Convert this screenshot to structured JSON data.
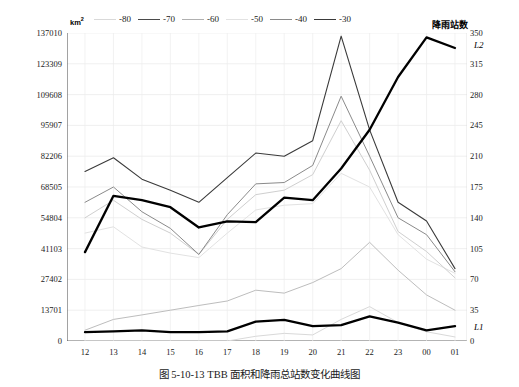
{
  "figure": {
    "caption": "图 5-10-13    TBB 面积和降雨总站数变化曲线图",
    "unit_left": "km",
    "unit_left_sup": "2",
    "right_axis_title": "降雨站数",
    "series_label_top": "L2",
    "series_label_bottom": "L1"
  },
  "legend": {
    "items": [
      {
        "label": "-80",
        "color": "#d9d9d9",
        "width": 1.0
      },
      {
        "label": "-70",
        "color": "#4a4a4a",
        "width": 1.1
      },
      {
        "label": "-60",
        "color": "#b0b0b0",
        "width": 1.0
      },
      {
        "label": "-50",
        "color": "#e2e2e2",
        "width": 1.0
      },
      {
        "label": "-40",
        "color": "#8a8a8a",
        "width": 1.0
      },
      {
        "label": "-30",
        "color": "#3a3a3a",
        "width": 1.2
      }
    ]
  },
  "chart_data": {
    "type": "line",
    "title": "TBB 面积和降雨总站数变化曲线图",
    "xlabel": "",
    "ylabel": "km2",
    "ylabel_right": "降雨站数",
    "grid": true,
    "legend_position": "top",
    "x": [
      "12",
      "13",
      "14",
      "15",
      "16",
      "17",
      "18",
      "19",
      "20",
      "21",
      "22",
      "23",
      "00",
      "01"
    ],
    "ylim": [
      0,
      137010
    ],
    "yticks": [
      0,
      13701,
      27402,
      41103,
      54804,
      68505,
      82206,
      95907,
      109608,
      123309,
      137010
    ],
    "ylim_right": [
      0,
      350
    ],
    "yticks_right": [
      0,
      35,
      70,
      105,
      140,
      175,
      210,
      245,
      280,
      315,
      350
    ],
    "series": [
      {
        "name": "-80",
        "axis": "left",
        "color": "#d9d9d9",
        "width": 1.0,
        "values": [
          0,
          0,
          0,
          0,
          0,
          0,
          2100,
          3400,
          2700,
          9600,
          15300,
          8200,
          4100,
          1800
        ]
      },
      {
        "name": "-70",
        "axis": "left",
        "color": "#bdbdbd",
        "width": 1.0,
        "values": [
          4800,
          9600,
          11600,
          13700,
          15800,
          17800,
          22600,
          21300,
          26000,
          32200,
          43900,
          31500,
          20500,
          13700
        ]
      },
      {
        "name": "-60",
        "axis": "left",
        "color": "#e2e2e2",
        "width": 1.0,
        "values": [
          48000,
          50800,
          41800,
          39100,
          37100,
          48000,
          58300,
          60400,
          61100,
          74600,
          68500,
          47300,
          36400,
          30100
        ]
      },
      {
        "name": "-50",
        "axis": "left",
        "color": "#cfcfcf",
        "width": 1.0,
        "values": [
          54800,
          62600,
          54100,
          48000,
          38500,
          54100,
          65100,
          67100,
          74000,
          98000,
          76000,
          48700,
          39800,
          28100
        ]
      },
      {
        "name": "-40",
        "axis": "left",
        "color": "#8a8a8a",
        "width": 1.0,
        "values": [
          61700,
          68500,
          57500,
          50100,
          38500,
          56200,
          69900,
          70500,
          78100,
          108900,
          82200,
          54800,
          47300,
          30800
        ]
      },
      {
        "name": "-30",
        "axis": "left",
        "color": "#3a3a3a",
        "width": 1.1,
        "values": [
          75400,
          81500,
          72000,
          67100,
          61700,
          72700,
          83600,
          82200,
          89100,
          135600,
          93900,
          61700,
          53400,
          32200
        ]
      },
      {
        "name": "降雨站数",
        "axis": "right",
        "color": "#000000",
        "width": 2.3,
        "values": [
          101,
          165,
          160,
          152,
          129,
          136,
          135,
          163,
          160,
          196,
          240,
          300,
          345,
          333
        ]
      },
      {
        "name": "L1",
        "axis": "right",
        "color": "#000000",
        "width": 2.3,
        "values": [
          10,
          11,
          12,
          10,
          10,
          11,
          22,
          24,
          17,
          18,
          28,
          21,
          12,
          17
        ]
      }
    ]
  }
}
